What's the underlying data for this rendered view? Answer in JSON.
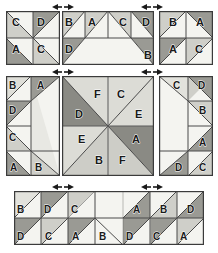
{
  "diagram": {
    "palette": {
      "background": "#ffffff",
      "outline": "#3b3b3b",
      "seam_line": "#4a4a4a",
      "white_patch": "#f4f4f0",
      "light_grey_patch": "#d9d9d4",
      "mid_grey_patch": "#b8b8b2",
      "dark_grey_patch": "#9a9a94",
      "darkest_grey_patch": "#8a8a84",
      "marker": "#1a1a1a"
    },
    "legend_letters": [
      "A",
      "B",
      "C",
      "D",
      "E",
      "F"
    ],
    "panels": [
      {
        "id": "top-left",
        "name": "top-left-four-patch",
        "rows": 2,
        "cols": 2,
        "cells": [
          {
            "label": "C",
            "row": 0,
            "col": 0,
            "tri": "lower-left",
            "shade": "mid"
          },
          {
            "label": "D",
            "row": 0,
            "col": 1,
            "tri": "upper-left",
            "shade": "dark"
          },
          {
            "label": "A",
            "row": 1,
            "col": 0,
            "tri": "lower-left",
            "shade": "dark"
          },
          {
            "label": "C",
            "row": 1,
            "col": 1,
            "tri": "lower-left",
            "shade": "mid"
          }
        ]
      },
      {
        "id": "top-center",
        "name": "top-center-border-unit",
        "rows": 2,
        "cols": 4,
        "cells": [
          {
            "label": "B",
            "row": 0,
            "col": 0,
            "tri": "upper-left",
            "shade": "mid"
          },
          {
            "label": "A",
            "row": 0,
            "col": 1,
            "tri": "upper-left",
            "shade": "mid"
          },
          {
            "label": "C",
            "row": 0,
            "col": 2,
            "tri": "upper-right",
            "shade": "mid"
          },
          {
            "label": "D",
            "row": 0,
            "col": 3,
            "tri": "upper-right",
            "shade": "dark"
          },
          {
            "label": "D",
            "row": 1,
            "col": 0,
            "tri": "upper-left",
            "shade": "dark"
          },
          {
            "label": "B",
            "row": 1,
            "col": 3,
            "tri": "upper-right",
            "shade": "dark"
          }
        ]
      },
      {
        "id": "top-right",
        "name": "top-right-four-patch",
        "rows": 2,
        "cols": 2,
        "cells": [
          {
            "label": "B",
            "row": 0,
            "col": 0,
            "tri": "upper-left",
            "shade": "mid"
          },
          {
            "label": "A",
            "row": 0,
            "col": 1,
            "tri": "upper-right",
            "shade": "dark"
          },
          {
            "label": "A",
            "row": 1,
            "col": 0,
            "tri": "upper-left",
            "shade": "dark"
          },
          {
            "label": "C",
            "row": 1,
            "col": 1,
            "tri": "upper-left",
            "shade": "mid"
          }
        ]
      },
      {
        "id": "middle-left",
        "name": "middle-left-side-unit",
        "rows": 4,
        "cols": 2,
        "cells": [
          {
            "label": "B",
            "row": 0,
            "col": 0,
            "tri": "upper-left",
            "shade": "light"
          },
          {
            "label": "A",
            "row": 0,
            "col": 1,
            "tri": "lower-left",
            "shade": "dark"
          },
          {
            "label": "D",
            "row": 1,
            "col": 0,
            "tri": "upper-left",
            "shade": "dark"
          },
          {
            "label": "C",
            "row": 2,
            "col": 0,
            "tri": "lower-left",
            "shade": "mid"
          },
          {
            "label": "A",
            "row": 3,
            "col": 0,
            "tri": "lower-left",
            "shade": "dark"
          },
          {
            "label": "B",
            "row": 3,
            "col": 1,
            "tri": "lower-right",
            "shade": "mid"
          }
        ]
      },
      {
        "id": "center",
        "name": "center-pinwheel-star",
        "rows": 2,
        "cols": 2,
        "cells": [
          {
            "label": "F",
            "position": "top-left-of-top-edge",
            "shade": "light"
          },
          {
            "label": "C",
            "position": "top-right-of-top-edge",
            "shade": "light"
          },
          {
            "label": "D",
            "position": "upper-left-side",
            "shade": "darkest"
          },
          {
            "label": "E",
            "position": "upper-right-side",
            "shade": "light"
          },
          {
            "label": "E",
            "position": "lower-left-side",
            "shade": "light"
          },
          {
            "label": "A",
            "position": "lower-right-side",
            "shade": "darkest"
          },
          {
            "label": "B",
            "position": "bottom-left-of-bottom-edge",
            "shade": "light"
          },
          {
            "label": "F",
            "position": "bottom-right-of-bottom-edge",
            "shade": "light"
          }
        ]
      },
      {
        "id": "middle-right",
        "name": "middle-right-side-unit",
        "rows": 4,
        "cols": 2,
        "cells": [
          {
            "label": "C",
            "row": 0,
            "col": 0,
            "tri": "upper-right",
            "shade": "mid"
          },
          {
            "label": "D",
            "row": 0,
            "col": 1,
            "tri": "upper-right",
            "shade": "dark"
          },
          {
            "label": "B",
            "row": 1,
            "col": 1,
            "tri": "upper-right",
            "shade": "mid"
          },
          {
            "label": "A",
            "row": 2,
            "col": 1,
            "tri": "lower-right",
            "shade": "dark"
          },
          {
            "label": "D",
            "row": 3,
            "col": 0,
            "tri": "lower-right",
            "shade": "dark"
          },
          {
            "label": "C",
            "row": 3,
            "col": 1,
            "tri": "lower-right",
            "shade": "mid"
          }
        ]
      },
      {
        "id": "bottom",
        "name": "bottom-border-unit",
        "rows": 2,
        "cols": 7,
        "cells": [
          {
            "label": "B",
            "row": 0,
            "col": 0,
            "tri": "upper-left",
            "shade": "light"
          },
          {
            "label": "D",
            "row": 0,
            "col": 1,
            "tri": "upper-left",
            "shade": "dark"
          },
          {
            "label": "C",
            "row": 0,
            "col": 2,
            "tri": "upper-left",
            "shade": "mid"
          },
          {
            "label": "A",
            "row": 0,
            "col": 4,
            "tri": "upper-right",
            "shade": "dark"
          },
          {
            "label": "B",
            "row": 0,
            "col": 5,
            "tri": "upper-right",
            "shade": "mid"
          },
          {
            "label": "D",
            "row": 0,
            "col": 6,
            "tri": "upper-right",
            "shade": "dark"
          },
          {
            "label": "D",
            "row": 1,
            "col": 0,
            "tri": "upper-left",
            "shade": "dark"
          },
          {
            "label": "C",
            "row": 1,
            "col": 1,
            "tri": "upper-left",
            "shade": "mid"
          },
          {
            "label": "A",
            "row": 1,
            "col": 2,
            "tri": "upper-left",
            "shade": "dark"
          },
          {
            "label": "B",
            "row": 1,
            "col": 3,
            "tri": "upper-left",
            "shade": "mid"
          },
          {
            "label": "D",
            "row": 1,
            "col": 3,
            "tri": "upper-right",
            "shade": "dark"
          },
          {
            "label": "C",
            "row": 1,
            "col": 4,
            "tri": "upper-right",
            "shade": "mid"
          },
          {
            "label": "A",
            "row": 1,
            "col": 5,
            "tri": "upper-right",
            "shade": "dark"
          },
          {
            "label": "B",
            "row": 1,
            "col": 6,
            "tri": "upper-right",
            "shade": "mid"
          }
        ]
      }
    ],
    "alignment_markers": [
      {
        "id": "marker-top-left",
        "x": 52,
        "y": 4,
        "type": "double-arrow-horizontal"
      },
      {
        "id": "marker-top-right",
        "x": 142,
        "y": 4,
        "type": "double-arrow-horizontal"
      },
      {
        "id": "marker-middle-left",
        "x": 52,
        "y": 70,
        "type": "double-arrow-horizontal"
      },
      {
        "id": "marker-middle-right",
        "x": 142,
        "y": 70,
        "type": "double-arrow-horizontal"
      },
      {
        "id": "marker-bottom-left",
        "x": 52,
        "y": 182,
        "type": "double-arrow-horizontal"
      },
      {
        "id": "marker-bottom-right",
        "x": 142,
        "y": 182,
        "type": "double-arrow-horizontal"
      }
    ],
    "labels": {
      "tl": [
        "C",
        "D",
        "A",
        "C"
      ],
      "tc": [
        "B",
        "A",
        "C",
        "D",
        "D",
        "B"
      ],
      "tr": [
        "B",
        "A",
        "A",
        "C"
      ],
      "ml": [
        "B",
        "A",
        "D",
        "C",
        "A",
        "B"
      ],
      "ctr": [
        "F",
        "C",
        "D",
        "E",
        "E",
        "A",
        "B",
        "F"
      ],
      "mr": [
        "C",
        "D",
        "B",
        "A",
        "D",
        "C"
      ],
      "bt": [
        "B",
        "D",
        "C",
        "A",
        "B",
        "D",
        "D",
        "C",
        "A",
        "B",
        "D",
        "C",
        "A",
        "B"
      ]
    }
  }
}
